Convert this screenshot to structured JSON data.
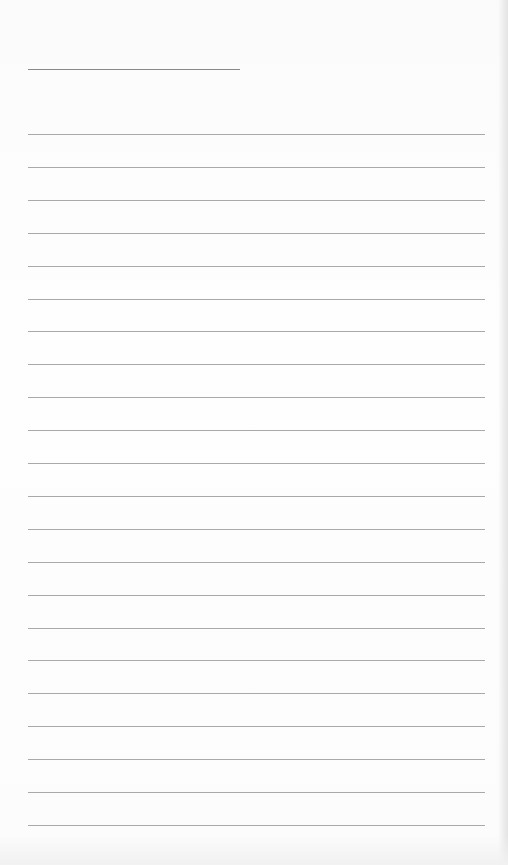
{
  "page": {
    "type": "lined-notepaper",
    "background": "#fdfdfd",
    "line_color": "#a9a9a9",
    "title_line": {
      "y": 69,
      "x_start": 28,
      "x_end": 240
    },
    "rules": {
      "count": 22,
      "first_y": 134,
      "spacing": 32.9,
      "x_start": 28,
      "x_end": 485
    }
  }
}
